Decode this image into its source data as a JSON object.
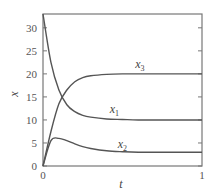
{
  "chart_data": {
    "type": "line",
    "title": "",
    "xlabel": "t",
    "ylabel": "x",
    "xlim": [
      0,
      1
    ],
    "ylim": [
      0,
      33
    ],
    "grid": false,
    "legend_position": "inline labels",
    "x_ticks": [
      0,
      1
    ],
    "x_tick_labels": [
      "0",
      "1"
    ],
    "y_ticks": [
      0,
      5,
      10,
      15,
      20,
      25,
      30
    ],
    "y_tick_labels": [
      "0",
      "5",
      "10",
      "15",
      "20",
      "25",
      "30"
    ],
    "x": [
      0,
      0.05,
      0.1,
      0.15,
      0.2,
      0.25,
      0.3,
      0.4,
      0.5,
      0.6,
      0.8,
      1.0
    ],
    "series": [
      {
        "name": "x1",
        "label_main": "x",
        "label_sub": "1",
        "values": [
          33,
          22.5,
          16.5,
          13.3,
          11.8,
          11.0,
          10.6,
          10.2,
          10.1,
          10.0,
          10.0,
          10.0
        ],
        "label_at": [
          0.42,
          11.5
        ]
      },
      {
        "name": "x2",
        "label_main": "x",
        "label_sub": "2",
        "values": [
          0,
          5.5,
          6.0,
          5.5,
          4.8,
          4.2,
          3.8,
          3.3,
          3.1,
          3.0,
          3.0,
          3.0
        ],
        "label_at": [
          0.47,
          3.9
        ]
      },
      {
        "name": "x3",
        "label_main": "x",
        "label_sub": "3",
        "values": [
          0,
          7.5,
          13.5,
          16.5,
          18.3,
          19.2,
          19.6,
          19.9,
          20.0,
          20.0,
          20.0,
          20.0
        ],
        "label_at": [
          0.58,
          21.2
        ]
      }
    ],
    "line_color": "#555555"
  }
}
